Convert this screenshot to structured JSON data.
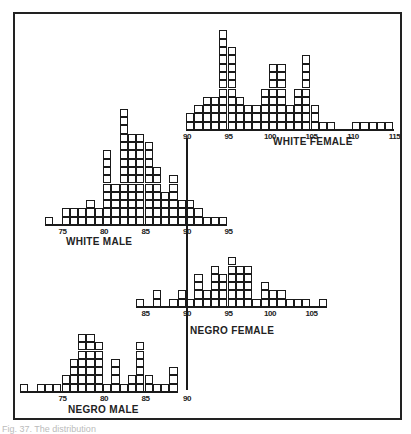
{
  "chart_data": [
    {
      "type": "bar",
      "title": "WHITE FEMALE",
      "x_start": 90,
      "values": [
        2,
        3,
        4,
        4,
        12,
        10,
        4,
        3,
        3,
        5,
        8,
        8,
        3,
        5,
        9,
        3,
        1,
        1,
        0,
        0,
        1,
        1,
        1,
        1,
        1
      ],
      "tick_labels": [
        "90",
        "95",
        "100",
        "105",
        "110",
        "115"
      ],
      "tick_values": [
        90,
        95,
        100,
        105,
        110,
        115
      ],
      "grid": false
    },
    {
      "type": "bar",
      "title": "WHITE MALE",
      "x_start": 73,
      "values": [
        1,
        0,
        2,
        2,
        2,
        3,
        2,
        9,
        5,
        14,
        11,
        11,
        10,
        7,
        4,
        6,
        3,
        3,
        2,
        1,
        1,
        1
      ],
      "tick_labels": [
        "75",
        "80",
        "85",
        "90",
        "95"
      ],
      "tick_values": [
        75,
        80,
        85,
        90,
        95
      ],
      "grid": false
    },
    {
      "type": "bar",
      "title": "NEGRO FEMALE",
      "x_start": 84,
      "values": [
        1,
        0,
        2,
        0,
        1,
        2,
        1,
        4,
        2,
        5,
        4,
        6,
        5,
        5,
        1,
        3,
        2,
        2,
        1,
        1,
        1,
        0,
        1
      ],
      "tick_labels": [
        "85",
        "90",
        "95",
        "100",
        "105"
      ],
      "tick_values": [
        85,
        90,
        95,
        100,
        105
      ],
      "grid": false
    },
    {
      "type": "bar",
      "title": "NEGRO MALE",
      "x_start": 70,
      "values": [
        1,
        0,
        1,
        1,
        1,
        2,
        4,
        7,
        7,
        6,
        1,
        4,
        1,
        2,
        6,
        2,
        1,
        1,
        3
      ],
      "tick_labels": [
        "75",
        "80",
        "85",
        "90"
      ],
      "tick_values": [
        75,
        80,
        85,
        90
      ],
      "grid": false
    }
  ],
  "labels": {
    "white_female": "WHITE FEMALE",
    "white_male": "WHITE MALE",
    "negro_female": "NEGRO FEMALE",
    "negro_male": "NEGRO MALE"
  },
  "caption": "Fig. 37.  The distribution"
}
